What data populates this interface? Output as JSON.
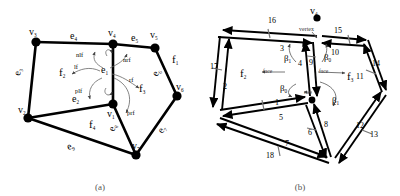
{
  "figure": {
    "panels": [
      {
        "id": "a",
        "caption": "(a)",
        "description": "Planar mesh with labelled vertices, edges and faces",
        "vertices": [
          {
            "name": "v1",
            "base": "v",
            "sub": "1",
            "x": 113,
            "y": 104
          },
          {
            "name": "v2",
            "base": "v",
            "sub": "2",
            "x": 28,
            "y": 118
          },
          {
            "name": "v3",
            "base": "v",
            "sub": "3",
            "x": 36,
            "y": 42
          },
          {
            "name": "v4",
            "base": "v",
            "sub": "4",
            "x": 113,
            "y": 44
          },
          {
            "name": "v5",
            "base": "v",
            "sub": "5",
            "x": 155,
            "y": 48
          },
          {
            "name": "v6",
            "base": "v",
            "sub": "6",
            "x": 177,
            "y": 96
          },
          {
            "name": "v7",
            "base": "v",
            "sub": "7",
            "x": 136,
            "y": 155
          }
        ],
        "vertex_labels": [
          {
            "base": "v",
            "sub": "1",
            "x": 107,
            "y": 117
          },
          {
            "base": "v",
            "sub": "2",
            "x": 23,
            "y": 110
          },
          {
            "base": "v",
            "sub": "3",
            "x": 33,
            "y": 35
          },
          {
            "base": "v",
            "sub": "4",
            "x": 113,
            "y": 36
          },
          {
            "base": "v",
            "sub": "5",
            "x": 155,
            "y": 38
          },
          {
            "base": "v",
            "sub": "6",
            "x": 180,
            "y": 90
          },
          {
            "base": "v",
            "sub": "7",
            "x": 138,
            "y": 147
          }
        ],
        "edges": [
          {
            "name": "e1",
            "from": "v4",
            "to": "v1"
          },
          {
            "name": "e2",
            "from": "v2",
            "to": "v1"
          },
          {
            "name": "e3",
            "from": "v3",
            "to": "v2"
          },
          {
            "name": "e4",
            "from": "v3",
            "to": "v4"
          },
          {
            "name": "e5",
            "from": "v4",
            "to": "v5"
          },
          {
            "name": "e6",
            "from": "v5",
            "to": "v6"
          },
          {
            "name": "e7",
            "from": "v6",
            "to": "v7"
          },
          {
            "name": "e8",
            "from": "v1",
            "to": "v7"
          },
          {
            "name": "e9",
            "from": "v2",
            "to": "v7"
          }
        ],
        "edge_labels": [
          {
            "base": "e",
            "sub": "1",
            "x": 104,
            "y": 73
          },
          {
            "base": "e",
            "sub": "2",
            "x": 75,
            "y": 101
          },
          {
            "base": "e",
            "sub": "3",
            "x": 24,
            "y": 75
          },
          {
            "base": "e",
            "sub": "4",
            "x": 73,
            "y": 38
          },
          {
            "base": "e",
            "sub": "5",
            "x": 135,
            "y": 41
          },
          {
            "base": "e",
            "sub": "6",
            "x": 161,
            "y": 75
          },
          {
            "base": "e",
            "sub": "7",
            "x": 167,
            "y": 133
          },
          {
            "base": "e",
            "sub": "8",
            "x": 118,
            "y": 131
          },
          {
            "base": "e",
            "sub": "9",
            "x": 72,
            "y": 149
          }
        ],
        "face_labels": [
          {
            "base": "f",
            "sub": "1",
            "x": 176,
            "y": 62
          },
          {
            "base": "f",
            "sub": "2",
            "x": 63,
            "y": 75
          },
          {
            "base": "f",
            "sub": "3",
            "x": 142,
            "y": 92
          },
          {
            "base": "f",
            "sub": "4",
            "x": 93,
            "y": 127
          }
        ],
        "operator_labels": [
          {
            "text": "nlf",
            "x": 86,
            "y": 56
          },
          {
            "text": "nrf",
            "x": 127,
            "y": 61
          },
          {
            "text": "lf",
            "x": 80,
            "y": 68
          },
          {
            "text": "rf",
            "x": 133,
            "y": 81
          },
          {
            "text": "plf",
            "x": 84,
            "y": 92
          },
          {
            "text": "prf",
            "x": 131,
            "y": 113
          }
        ]
      },
      {
        "id": "b",
        "caption": "(b)",
        "description": "Corresponding half-edge (directed edge) structure with numbered darts",
        "apex_vertex": {
          "base": "v",
          "sub": "4",
          "x": 117,
          "y": 12
        },
        "annotations": [
          {
            "text": "vertex",
            "x": 114,
            "y": 29
          },
          {
            "text": "face",
            "x": 65,
            "y": 74
          },
          {
            "text": "face",
            "x": 121,
            "y": 74
          },
          {
            "text": "face",
            "x": 106,
            "y": 92
          }
        ],
        "face_labels": [
          {
            "base": "f",
            "sub": "2",
            "x": 47,
            "y": 75
          },
          {
            "base": "f",
            "sub": "3",
            "x": 150,
            "y": 79
          }
        ],
        "beta_labels": [
          {
            "base": "β",
            "sub": "1",
            "x": 88,
            "y": 58
          },
          {
            "base": "β",
            "sub": "0",
            "x": 125,
            "y": 58
          },
          {
            "base": "β",
            "sub": "0",
            "x": 85,
            "y": 90
          },
          {
            "base": "β",
            "sub": "1",
            "x": 135,
            "y": 101
          }
        ],
        "dart_labels": [
          {
            "text": "1",
            "x": 78,
            "y": 102
          },
          {
            "text": "2",
            "x": 26,
            "y": 87
          },
          {
            "text": "3",
            "x": 83,
            "y": 48
          },
          {
            "text": "4",
            "x": 101,
            "y": 63
          },
          {
            "text": "5",
            "x": 82,
            "y": 117
          },
          {
            "text": "6",
            "x": 112,
            "y": 132
          },
          {
            "text": "7",
            "x": 88,
            "y": 144
          },
          {
            "text": "8",
            "x": 127,
            "y": 124
          },
          {
            "text": "9",
            "x": 112,
            "y": 62
          },
          {
            "text": "10",
            "x": 135,
            "y": 52
          },
          {
            "text": "11",
            "x": 160,
            "y": 76
          },
          {
            "text": "12",
            "x": 160,
            "y": 125
          },
          {
            "text": "13",
            "x": 173,
            "y": 134
          },
          {
            "text": "14",
            "x": 175,
            "y": 63
          },
          {
            "text": "15",
            "x": 138,
            "y": 30
          },
          {
            "text": "16",
            "x": 72,
            "y": 20
          },
          {
            "text": "17",
            "x": 15,
            "y": 66
          },
          {
            "text": "18",
            "x": 70,
            "y": 155
          }
        ]
      }
    ]
  },
  "colors": {
    "stroke": "#000000",
    "light_stroke": "#555555",
    "background": "#ffffff",
    "caption": "#555555"
  }
}
